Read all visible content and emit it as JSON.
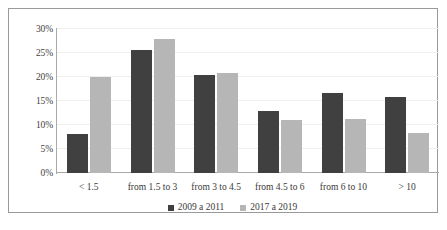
{
  "chart_data": {
    "type": "bar",
    "title": "",
    "subtitle": "",
    "xlabel": "",
    "ylabel": "",
    "categories": [
      "< 1.5",
      "from 1.5 to 3",
      "from 3 to 4.5",
      "from 4.5 to 6",
      "from 6 to 10",
      "> 10"
    ],
    "series": [
      {
        "name": "2009 a 2011",
        "color": "#404040",
        "values": [
          8.2,
          25.7,
          20.4,
          13.0,
          16.7,
          15.9
        ]
      },
      {
        "name": "2017 a 2019",
        "color": "#b6b6b6",
        "values": [
          20.0,
          28.0,
          20.8,
          11.0,
          11.2,
          8.3
        ]
      }
    ],
    "ylim": [
      0,
      30
    ],
    "ytick_values": [
      0,
      5,
      10,
      15,
      20,
      25,
      30
    ],
    "ytick_labels": [
      "0%",
      "5%",
      "10%",
      "15%",
      "20%",
      "25%",
      "30%"
    ],
    "grid": true,
    "grid_axis": "y",
    "legend_position": "bottom-center",
    "value_format": "percent"
  },
  "caption": {
    "text": ""
  }
}
